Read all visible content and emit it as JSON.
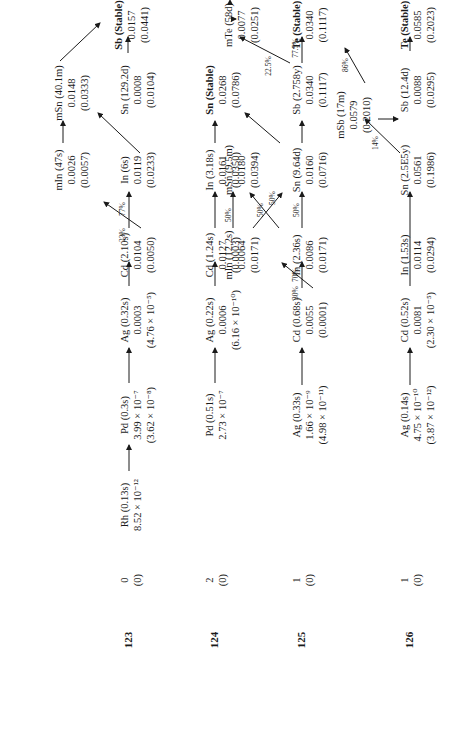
{
  "diagram": {
    "rows": [
      {
        "mass": "123",
        "side": [
          "0",
          "(0)"
        ],
        "nodes": [
          {
            "id": "rh123",
            "name": "Rh (0.13s)",
            "vals": [
              "8.52 × 10⁻¹²"
            ]
          },
          {
            "id": "pd123",
            "name": "Pd (0.3s)",
            "vals": [
              "3.99 × 10⁻⁷",
              "(3.62 × 10⁻⁸)"
            ]
          },
          {
            "id": "ag123",
            "name": "Ag (0.32s)",
            "vals": [
              "0.0003",
              "(4.76 × 10⁻⁵)"
            ]
          },
          {
            "id": "cd123",
            "name": "Cd (2.10s)",
            "vals": [
              "0.0104",
              "(0.0050)"
            ]
          },
          {
            "id": "min123",
            "name": "mIn (47s)",
            "vals": [
              "0.0026",
              "(0.0057)"
            ]
          },
          {
            "id": "in123",
            "name": "In (6s)",
            "vals": [
              "0.0119",
              "(0.0233)"
            ]
          },
          {
            "id": "msn123",
            "name": "mSn (40.1m)",
            "vals": [
              "0.0148",
              "(0.0333)"
            ]
          },
          {
            "id": "sn123",
            "name": "Sn (129.2d)",
            "vals": [
              "0.0008",
              "(0.0104)"
            ]
          },
          {
            "id": "sb123",
            "name": "Sb (Stable)",
            "vals": [
              "0.0157",
              "(0.0441)"
            ],
            "bold": true
          }
        ],
        "branches": [
          {
            "label": "23%"
          },
          {
            "label": "77%"
          }
        ]
      },
      {
        "mass": "124",
        "side": [
          "2",
          "(0)"
        ],
        "nodes": [
          {
            "id": "pd124",
            "name": "Pd (0.51s)",
            "vals": [
              "2.73 × 10⁻⁷"
            ]
          },
          {
            "id": "ag124",
            "name": "Ag (0.22s)",
            "vals": [
              "0.0006",
              "(6.16 × 10⁻¹⁰)"
            ]
          },
          {
            "id": "cd124",
            "name": "Cd (1.24s)",
            "vals": [
              "0.0127",
              "(0.0003)"
            ]
          },
          {
            "id": "in124",
            "name": "In (3.18s)",
            "vals": [
              "0.0161",
              "(0.0350)"
            ]
          },
          {
            "id": "sn124",
            "name": "Sn (Stable)",
            "vals": [
              "0.0268",
              "(0.0786)"
            ],
            "bold": true
          }
        ]
      },
      {
        "mass": "125",
        "side": [
          "1",
          "(0)"
        ],
        "nodes": [
          {
            "id": "ag125",
            "name": "Ag (0.33s)",
            "vals": [
              "1.66 × 10⁻⁹",
              "(4.98 × 10⁻¹¹)"
            ]
          },
          {
            "id": "cd125",
            "name": "Cd (0.68s)",
            "vals": [
              "0.0055",
              "(0.0001)"
            ]
          },
          {
            "id": "min125",
            "name": "mIn (12.2s)",
            "vals": [
              "0.0064",
              "(0.0171)"
            ]
          },
          {
            "id": "in125",
            "name": "In (2.36s)",
            "vals": [
              "0.0086",
              "(0.0171)"
            ]
          },
          {
            "id": "msn125",
            "name": "mSn (9.5m)",
            "vals": [
              "0.0180",
              "(0.0394)"
            ]
          },
          {
            "id": "sn125",
            "name": "Sn (9.64d)",
            "vals": [
              "0.0160",
              "(0.0716)"
            ]
          },
          {
            "id": "sb125",
            "name": "Sb (2.758y)",
            "vals": [
              "0.0340",
              "(0.1117)"
            ]
          },
          {
            "id": "mte125",
            "name": "mTe (58d)",
            "vals": [
              "0.0077",
              "(0.0251)"
            ]
          },
          {
            "id": "te125",
            "name": "Te (Stable)",
            "vals": [
              "0.0340",
              "(0.1117)"
            ],
            "bold": true
          }
        ],
        "branches": [
          {
            "label": "30%"
          },
          {
            "label": "70%"
          },
          {
            "label": "50%"
          },
          {
            "label": "50%"
          },
          {
            "label": "50%"
          },
          {
            "label": "50%"
          },
          {
            "label": "22.5%"
          },
          {
            "label": "77.5%"
          }
        ]
      },
      {
        "mass": "126",
        "side": [
          "1",
          "(0)"
        ],
        "nodes": [
          {
            "id": "ag126",
            "name": "Ag (0.14s)",
            "vals": [
              "4.75 × 10⁻¹⁰",
              "(3.87 × 10⁻¹²)"
            ]
          },
          {
            "id": "cd126",
            "name": "Cd (0.52s)",
            "vals": [
              "0.0081",
              "(2.30 × 10⁻⁵)"
            ]
          },
          {
            "id": "in126",
            "name": "In (1.53s)",
            "vals": [
              "0.0114",
              "(0.0294)"
            ]
          },
          {
            "id": "sn126",
            "name": "Sn (2.5E5y)",
            "vals": [
              "0.0561",
              "(0.1986)"
            ]
          },
          {
            "id": "msb126",
            "name": "mSb (17m)",
            "vals": [
              "0.0579",
              "(0.2010)"
            ]
          },
          {
            "id": "sb126",
            "name": "Sb (12.4d)",
            "vals": [
              "0.0088",
              "(0.0295)"
            ]
          },
          {
            "id": "te126",
            "name": "Te (Stable)",
            "vals": [
              "0.0585",
              "(0.2023)"
            ],
            "bold": true
          }
        ],
        "branches": [
          {
            "label": "14%"
          },
          {
            "label": "86%"
          }
        ]
      }
    ]
  }
}
